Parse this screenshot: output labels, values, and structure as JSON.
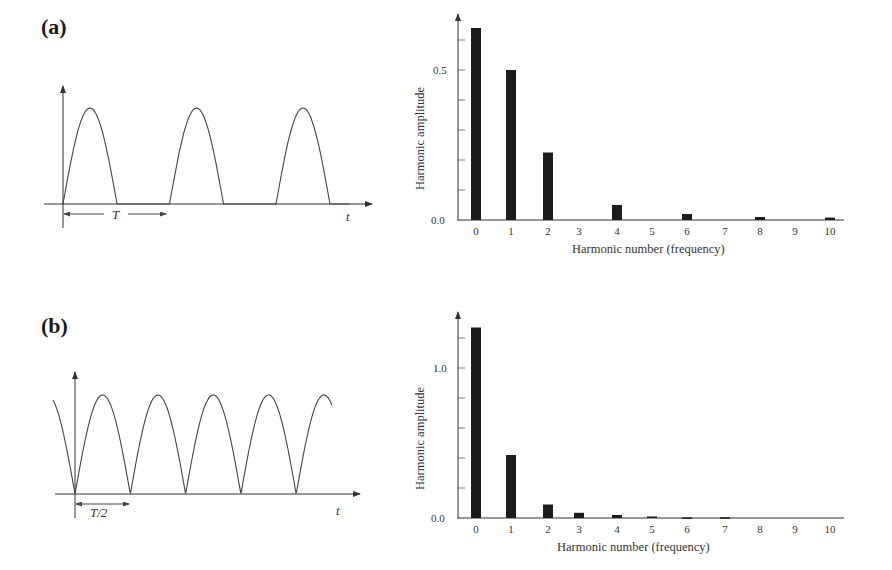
{
  "panels": [
    {
      "label": "(a)",
      "waveform": {
        "description": "half-wave rectified sine",
        "time_label": "t",
        "period_label": "T"
      }
    },
    {
      "label": "(b)",
      "waveform": {
        "description": "full-wave rectified sine",
        "time_label": "t",
        "period_label": "T/2"
      }
    }
  ],
  "chart_data": [
    {
      "type": "bar",
      "title": "(a)",
      "xlabel": "Harmonic number (frequency)",
      "ylabel": "Harmonic amplitude",
      "categories": [
        "0",
        "1",
        "2",
        "3",
        "4",
        "5",
        "6",
        "7",
        "8",
        "9",
        "10"
      ],
      "values": [
        0.64,
        0.5,
        0.225,
        0.0,
        0.05,
        0.0,
        0.02,
        0.0,
        0.01,
        0.0,
        0.008
      ],
      "yticks": [
        "0.0",
        "0.5"
      ],
      "ylim": [
        0,
        0.7
      ],
      "grid": false
    },
    {
      "type": "bar",
      "title": "(b)",
      "xlabel": "Harmonic number (frequency)",
      "ylabel": "Harmonic amplitude",
      "categories": [
        "0",
        "1",
        "2",
        "3",
        "4",
        "5",
        "6",
        "7",
        "8",
        "9",
        "10"
      ],
      "values": [
        1.27,
        0.42,
        0.09,
        0.035,
        0.02,
        0.01,
        0.004,
        0.005,
        0.0,
        0.0,
        0.0
      ],
      "yticks": [
        "0.0",
        "1.0"
      ],
      "ylim": [
        0,
        1.35
      ],
      "grid": false
    }
  ]
}
